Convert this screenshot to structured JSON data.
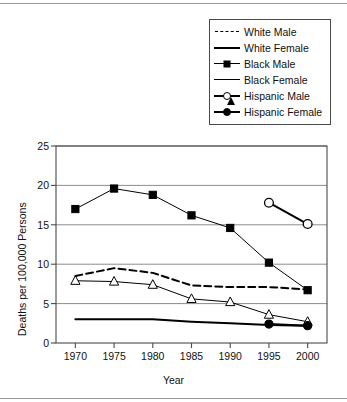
{
  "chart_data": {
    "type": "line",
    "title": "",
    "xlabel": "Year",
    "ylabel": "Deaths per 100,000 Persons",
    "x": [
      1970,
      1975,
      1980,
      1985,
      1990,
      1995,
      2000
    ],
    "xtick_labels": [
      "1970",
      "1975",
      "1980",
      "1985",
      "1990",
      "1995",
      "2000"
    ],
    "ytick_labels": [
      "0",
      "5",
      "10",
      "15",
      "20",
      "25"
    ],
    "yticks": [
      0,
      5,
      10,
      15,
      20,
      25
    ],
    "xlim": [
      1967.5,
      2002.5
    ],
    "ylim": [
      0,
      25
    ],
    "grid": "horizontal",
    "legend_position": "top-right",
    "series": [
      {
        "name": "White Male",
        "style": "dashed",
        "marker": "none",
        "x": [
          1970,
          1975,
          1980,
          1985,
          1990,
          1995,
          2000
        ],
        "values": [
          8.5,
          9.5,
          8.9,
          7.3,
          7.1,
          7.1,
          6.8
        ]
      },
      {
        "name": "White Female",
        "style": "solid-thick",
        "marker": "none",
        "x": [
          1970,
          1975,
          1980,
          1985,
          1990,
          1995,
          2000
        ],
        "values": [
          3.0,
          3.0,
          3.0,
          2.7,
          2.5,
          2.3,
          2.2
        ]
      },
      {
        "name": "Black Male",
        "style": "solid-thin",
        "marker": "filled-square",
        "x": [
          1970,
          1975,
          1980,
          1985,
          1990,
          1995,
          2000
        ],
        "values": [
          17.0,
          19.6,
          18.8,
          16.2,
          14.6,
          10.2,
          6.7
        ]
      },
      {
        "name": "Black Female",
        "style": "solid-thin",
        "marker": "open-triangle",
        "x": [
          1970,
          1975,
          1980,
          1985,
          1990,
          1995,
          2000
        ],
        "values": [
          7.9,
          7.8,
          7.4,
          5.6,
          5.2,
          3.6,
          2.7
        ]
      },
      {
        "name": "Hispanic Male",
        "style": "solid-thick",
        "marker": "open-circle",
        "x": [
          1995,
          2000
        ],
        "values": [
          17.8,
          15.1
        ]
      },
      {
        "name": "Hispanic Female",
        "style": "solid-thick",
        "marker": "filled-circle",
        "x": [
          1995,
          2000
        ],
        "values": [
          2.4,
          2.2
        ]
      }
    ]
  },
  "legend": {
    "items": [
      {
        "label": "White Male",
        "sample": "dashed-line-sample"
      },
      {
        "label": "White Female",
        "sample": "solid-line-sample"
      },
      {
        "label": "Black Male",
        "sample": "filled-square-marker-sample"
      },
      {
        "label": "Black Female",
        "sample": "open-triangle-marker-sample"
      },
      {
        "label": "Hispanic Male",
        "sample": "open-circle-marker-sample"
      },
      {
        "label": "Hispanic Female",
        "sample": "filled-circle-marker-sample"
      }
    ]
  },
  "colors": {
    "ink": "#000000",
    "grid": "#8c8c8c",
    "frame": "#4a4a4a",
    "background": "#ffffff"
  }
}
